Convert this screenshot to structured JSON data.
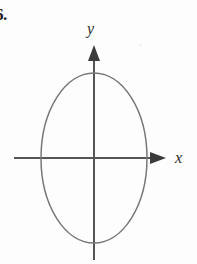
{
  "figure": {
    "problem_number": "6.",
    "background_color": "#fdfdfd",
    "width": 197,
    "height": 264
  },
  "axes": {
    "color": "#555555",
    "stroke_width": 2,
    "origin": {
      "x": 94,
      "y": 158
    },
    "x_axis": {
      "label": "x",
      "start_x": 14,
      "end_x": 166,
      "y": 158,
      "arrow": "right-arrowhead"
    },
    "y_axis": {
      "label": "y",
      "x": 94,
      "start_y": 45,
      "end_y": 260,
      "arrow": "up-arrowhead"
    }
  },
  "chart_data": {
    "type": "line",
    "title": "",
    "subtitle": "",
    "xlabel": "x",
    "ylabel": "y",
    "grid": false,
    "legend": null,
    "curve": {
      "name": "ellipse",
      "shape": "ellipse",
      "center": [
        0,
        0
      ],
      "semi_axis_x": 53,
      "semi_axis_y": 85,
      "orientation": "vertical-major-axis",
      "stroke_color": "#777777",
      "stroke_width": 1.5,
      "fill": "none",
      "x_intercepts": [
        -53,
        53
      ],
      "y_intercepts": [
        -85,
        85
      ],
      "pixel_extents": {
        "left_x": 41,
        "right_x": 146,
        "top_y": 74,
        "bottom_y": 243
      }
    },
    "xlim": [
      -80,
      72
    ],
    "ylim": [
      -102,
      113
    ]
  },
  "marks": {
    "speck_label": "scan-artifact"
  }
}
